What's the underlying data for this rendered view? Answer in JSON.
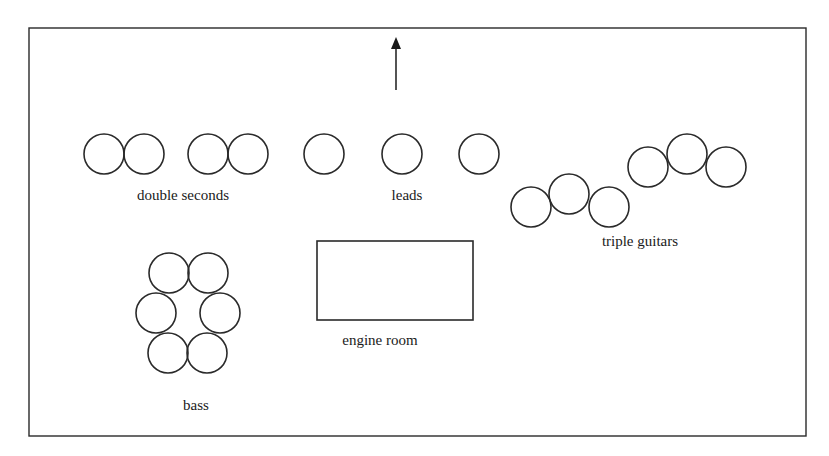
{
  "diagram": {
    "frame": {
      "x": 29,
      "y": 28,
      "width": 777,
      "height": 408
    },
    "direction_arrow": {
      "x": 396,
      "tip_y": 37,
      "head_base_y": 49,
      "tail_y": 90,
      "meaning": "audience / front"
    },
    "circle_radius": 20,
    "sections": [
      {
        "id": "double-seconds",
        "label": "double seconds",
        "label_pos": {
          "x": 183,
          "y": 200
        },
        "drums": [
          {
            "cx": 104,
            "cy": 154
          },
          {
            "cx": 144,
            "cy": 154
          },
          {
            "cx": 208,
            "cy": 154
          },
          {
            "cx": 248,
            "cy": 154
          }
        ]
      },
      {
        "id": "leads",
        "label": "leads",
        "label_pos": {
          "x": 407,
          "y": 200
        },
        "drums": [
          {
            "cx": 324,
            "cy": 154
          },
          {
            "cx": 402,
            "cy": 154
          },
          {
            "cx": 479,
            "cy": 154
          }
        ]
      },
      {
        "id": "triple-guitars",
        "label": "triple guitars",
        "label_pos": {
          "x": 640,
          "y": 246
        },
        "drums": [
          {
            "cx": 531,
            "cy": 207
          },
          {
            "cx": 569,
            "cy": 194
          },
          {
            "cx": 609,
            "cy": 207
          },
          {
            "cx": 648,
            "cy": 167
          },
          {
            "cx": 687,
            "cy": 154
          },
          {
            "cx": 726,
            "cy": 167
          }
        ]
      },
      {
        "id": "bass",
        "label": "bass",
        "label_pos": {
          "x": 196,
          "y": 410
        },
        "drums": [
          {
            "cx": 169,
            "cy": 273
          },
          {
            "cx": 208,
            "cy": 273
          },
          {
            "cx": 156,
            "cy": 313
          },
          {
            "cx": 220,
            "cy": 313
          },
          {
            "cx": 168,
            "cy": 353
          },
          {
            "cx": 207,
            "cy": 353
          }
        ]
      }
    ],
    "engine_room": {
      "label": "engine room",
      "rect": {
        "x": 317,
        "y": 241,
        "width": 156,
        "height": 79
      },
      "label_pos": {
        "x": 380,
        "y": 345
      }
    },
    "colors": {
      "stroke": "#2a2a2a",
      "text": "#1a1a1a",
      "background": "#ffffff"
    }
  }
}
